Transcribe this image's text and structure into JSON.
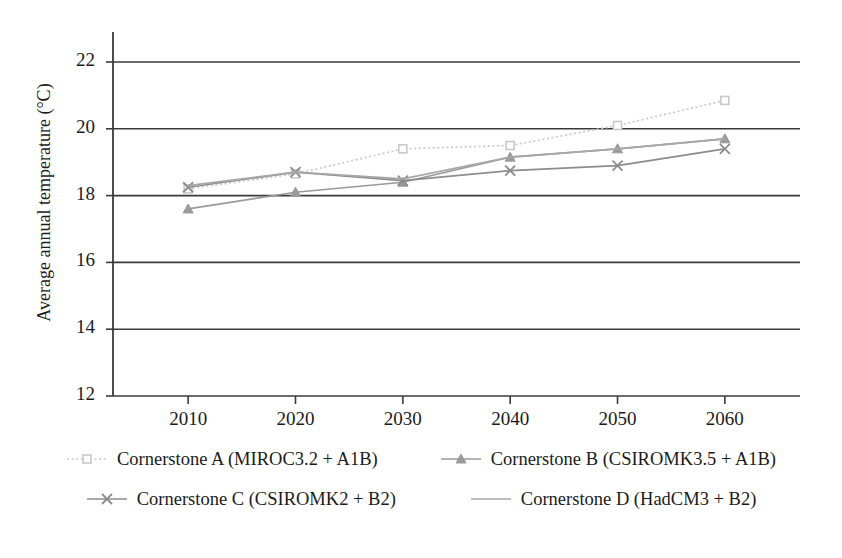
{
  "chart_data": {
    "type": "line",
    "title": "",
    "xlabel": "",
    "ylabel": "Average annual temperature (°C)",
    "x": [
      2010,
      2020,
      2030,
      2040,
      2050,
      2060
    ],
    "xtick_labels": [
      "2010",
      "2020",
      "2030",
      "2040",
      "2050",
      "2060"
    ],
    "ytick_labels": [
      "12",
      "14",
      "16",
      "18",
      "20",
      "22"
    ],
    "yticks": [
      12,
      14,
      16,
      18,
      20,
      22
    ],
    "ylim": [
      12,
      22
    ],
    "xlim": [
      2003,
      2067
    ],
    "grid": "horizontal",
    "legend_position": "bottom",
    "series": [
      {
        "name": "Cornerstone A (MIROC3.2 + A1B)",
        "values": [
          18.2,
          18.65,
          19.4,
          19.5,
          20.1,
          20.85
        ],
        "color": "#c9c9c9",
        "marker": "square",
        "linestyle": "dotted"
      },
      {
        "name": "Cornerstone B (CSIROMK3.5 + A1B)",
        "values": [
          17.6,
          18.1,
          18.4,
          19.15,
          19.4,
          19.7
        ],
        "color": "#9a9a9a",
        "marker": "triangle",
        "linestyle": "solid"
      },
      {
        "name": "Cornerstone C (CSIROMK2 + B2)",
        "values": [
          18.25,
          18.7,
          18.45,
          18.75,
          18.9,
          19.4
        ],
        "color": "#8c8c8c",
        "marker": "cross",
        "linestyle": "solid"
      },
      {
        "name": "Cornerstone D (HadCM3 + B2)",
        "values": [
          18.3,
          18.7,
          18.5,
          19.15,
          19.4,
          19.7
        ],
        "color": "#a8a8a8",
        "marker": "none",
        "linestyle": "solid"
      }
    ]
  },
  "legend": {
    "rows": [
      [
        "Cornerstone A (MIROC3.2 + A1B)",
        "Cornerstone B (CSIROMK3.5 + A1B)"
      ],
      [
        "Cornerstone C (CSIROMK2 + B2)",
        "Cornerstone D (HadCM3 + B2)"
      ]
    ]
  },
  "colors": {
    "axis": "#3a3a3a",
    "grid": "#3a3a3a",
    "text": "#1b1b1b",
    "background": "#ffffff"
  }
}
